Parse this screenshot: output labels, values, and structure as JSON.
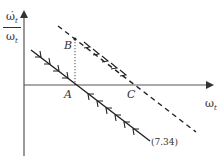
{
  "diagram": {
    "type": "phase-diagram",
    "y_axis_label": {
      "numerator": "ω̇",
      "numerator_sub": "t",
      "denominator": "ω",
      "denominator_sub": "t"
    },
    "x_axis_label": {
      "symbol": "ω",
      "sub": "t"
    },
    "points": {
      "A": "A",
      "B": "B",
      "C": "C"
    },
    "curves": [
      {
        "name": "solid-line",
        "style": "solid",
        "label": "(7.34)",
        "arrows": "converging toward A"
      },
      {
        "name": "dashed-line",
        "style": "dashed",
        "arrows": "pointing down-right, from B through C"
      }
    ],
    "guides": [
      {
        "name": "dotted-vertical",
        "from": "B",
        "to": "A"
      }
    ]
  }
}
